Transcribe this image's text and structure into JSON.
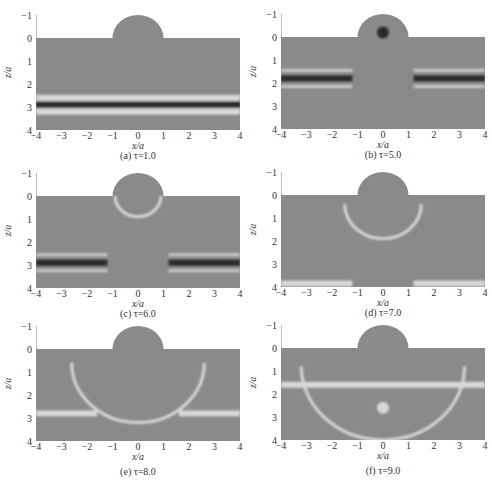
{
  "chart_data": [
    {
      "id": "a",
      "type": "heatmap",
      "caption": "(a)  τ=1.0",
      "tau": 1.0,
      "xlabel": "x/a",
      "ylabel": "z/a",
      "xticks": [
        -4,
        -3,
        -2,
        -1,
        0,
        1,
        2,
        3,
        4
      ],
      "yticks": [
        -1,
        0,
        1,
        2,
        3,
        4
      ],
      "xlim": [
        -4,
        4
      ],
      "ylim": [
        4,
        -1
      ],
      "features": [
        {
          "kind": "band",
          "z": 2.9,
          "shade": "dark",
          "x": [
            -4,
            4
          ]
        },
        {
          "kind": "band",
          "z": 2.6,
          "shade": "light",
          "x": [
            -4,
            4
          ]
        },
        {
          "kind": "band",
          "z": 3.2,
          "shade": "light",
          "x": [
            -4,
            4
          ]
        }
      ]
    },
    {
      "id": "b",
      "type": "heatmap",
      "caption": "(b)  τ=5.0",
      "tau": 5.0,
      "xlabel": "x/a",
      "ylabel": "z/a",
      "xticks": [
        -4,
        -3,
        -2,
        -1,
        0,
        1,
        2,
        3,
        4
      ],
      "yticks": [
        -1,
        0,
        1,
        2,
        3,
        4
      ],
      "xlim": [
        -4,
        4
      ],
      "ylim": [
        4,
        -1
      ],
      "features": [
        {
          "kind": "band",
          "z": 1.8,
          "shade": "dark",
          "x": [
            -4,
            -1.2
          ]
        },
        {
          "kind": "band",
          "z": 1.8,
          "shade": "dark",
          "x": [
            1.2,
            4
          ]
        },
        {
          "kind": "spot",
          "x": 0,
          "z": -0.2,
          "shade": "dark"
        }
      ]
    },
    {
      "id": "c",
      "type": "heatmap",
      "caption": "(c)  τ=6.0",
      "tau": 6.0,
      "xlabel": "x/a",
      "ylabel": "z/a",
      "xticks": [
        -4,
        -3,
        -2,
        -1,
        0,
        1,
        2,
        3,
        4
      ],
      "yticks": [
        -1,
        0,
        1,
        2,
        3,
        4
      ],
      "xlim": [
        -4,
        4
      ],
      "ylim": [
        4,
        -1
      ],
      "features": [
        {
          "kind": "band",
          "z": 2.9,
          "shade": "dark",
          "x": [
            -4,
            -1.2
          ]
        },
        {
          "kind": "band",
          "z": 2.9,
          "shade": "dark",
          "x": [
            1.2,
            4
          ]
        },
        {
          "kind": "arc",
          "center_z": 0,
          "radius": 0.9,
          "shade": "light"
        }
      ]
    },
    {
      "id": "d",
      "type": "heatmap",
      "caption": "(d)  τ=7.0",
      "tau": 7.0,
      "xlabel": "x/a",
      "ylabel": "z/a",
      "xticks": [
        -4,
        -3,
        -2,
        -1,
        0,
        1,
        2,
        3,
        4
      ],
      "yticks": [
        -1,
        0,
        1,
        2,
        3,
        4
      ],
      "xlim": [
        -4,
        4
      ],
      "ylim": [
        4,
        -1
      ],
      "features": [
        {
          "kind": "band",
          "z": 3.85,
          "shade": "light",
          "x": [
            -4,
            -1.2
          ]
        },
        {
          "kind": "band",
          "z": 3.85,
          "shade": "light",
          "x": [
            1.2,
            4
          ]
        },
        {
          "kind": "arc",
          "center_z": 0.4,
          "radius": 1.5,
          "shade": "light"
        }
      ]
    },
    {
      "id": "e",
      "type": "heatmap",
      "caption": "(e)  τ=8.0",
      "tau": 8.0,
      "xlabel": "x/a",
      "ylabel": "z/a",
      "xticks": [
        -4,
        -3,
        -2,
        -1,
        0,
        1,
        2,
        3,
        4
      ],
      "yticks": [
        -1,
        0,
        1,
        2,
        3,
        4
      ],
      "xlim": [
        -4,
        4
      ],
      "ylim": [
        4,
        -1
      ],
      "features": [
        {
          "kind": "band",
          "z": 2.8,
          "shade": "light",
          "x": [
            -4,
            -1.6
          ]
        },
        {
          "kind": "band",
          "z": 2.8,
          "shade": "light",
          "x": [
            1.6,
            4
          ]
        },
        {
          "kind": "arc",
          "center_z": 0.6,
          "radius": 2.6,
          "shade": "light"
        }
      ]
    },
    {
      "id": "f",
      "type": "heatmap",
      "caption": "(f)  τ=9.0",
      "tau": 9.0,
      "xlabel": "x/a",
      "ylabel": "z/a",
      "xticks": [
        -4,
        -3,
        -2,
        -1,
        0,
        1,
        2,
        3,
        4
      ],
      "yticks": [
        -1,
        0,
        1,
        2,
        3,
        4
      ],
      "xlim": [
        -4,
        4
      ],
      "ylim": [
        4,
        -1
      ],
      "features": [
        {
          "kind": "band",
          "z": 1.6,
          "shade": "light",
          "x": [
            -4,
            4
          ]
        },
        {
          "kind": "arc",
          "center_z": 0.8,
          "radius": 3.2,
          "shade": "light"
        },
        {
          "kind": "spot",
          "x": 0,
          "z": 2.6,
          "shade": "light"
        }
      ]
    }
  ],
  "colors": {
    "field": "#8a8a8a",
    "dark": "#2a2a2a",
    "light": "#d8d8d8",
    "axis": "#555555"
  }
}
